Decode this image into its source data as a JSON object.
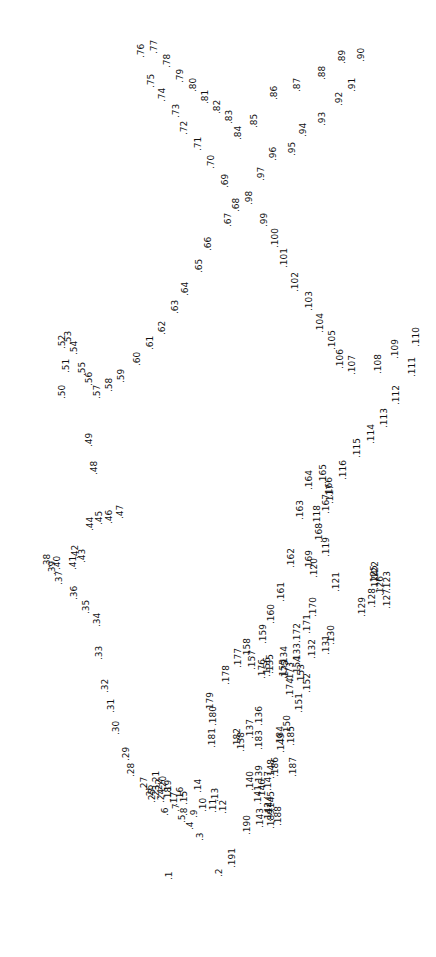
{
  "puzzle": {
    "kind": "connect-the-dots",
    "orientation": "labels-rotated-90-ccw",
    "background_color": "#ffffff",
    "text_color": "#111111",
    "font_size_px": 9,
    "total_points": 191,
    "marker": ".",
    "points": [
      {
        "n": "1",
        "x": 165,
        "y": 880
      },
      {
        "n": "2",
        "x": 215,
        "y": 877
      },
      {
        "n": "3",
        "x": 196,
        "y": 841
      },
      {
        "n": "4",
        "x": 186,
        "y": 830
      },
      {
        "n": "5",
        "x": 178,
        "y": 823
      },
      {
        "n": "6",
        "x": 161,
        "y": 816
      },
      {
        "n": "7",
        "x": 172,
        "y": 812
      },
      {
        "n": "8",
        "x": 180,
        "y": 816
      },
      {
        "n": "9",
        "x": 190,
        "y": 818
      },
      {
        "n": "10",
        "x": 199,
        "y": 812
      },
      {
        "n": "11",
        "x": 209,
        "y": 813
      },
      {
        "n": "12",
        "x": 219,
        "y": 814
      },
      {
        "n": "13",
        "x": 211,
        "y": 802
      },
      {
        "n": "14",
        "x": 194,
        "y": 793
      },
      {
        "n": "15",
        "x": 180,
        "y": 805
      },
      {
        "n": "16",
        "x": 176,
        "y": 801
      },
      {
        "n": "17",
        "x": 170,
        "y": 806
      },
      {
        "n": "18",
        "x": 164,
        "y": 801
      },
      {
        "n": "19",
        "x": 164,
        "y": 794
      },
      {
        "n": "20",
        "x": 159,
        "y": 790
      },
      {
        "n": "21",
        "x": 152,
        "y": 785
      },
      {
        "n": "22",
        "x": 155,
        "y": 793
      },
      {
        "n": "23",
        "x": 152,
        "y": 799
      },
      {
        "n": "24",
        "x": 157,
        "y": 803
      },
      {
        "n": "25",
        "x": 148,
        "y": 803
      },
      {
        "n": "26",
        "x": 146,
        "y": 799
      },
      {
        "n": "27",
        "x": 140,
        "y": 791
      },
      {
        "n": "28",
        "x": 127,
        "y": 777
      },
      {
        "n": "29",
        "x": 122,
        "y": 761
      },
      {
        "n": "30",
        "x": 112,
        "y": 735
      },
      {
        "n": "31",
        "x": 107,
        "y": 713
      },
      {
        "n": "32",
        "x": 101,
        "y": 693
      },
      {
        "n": "33",
        "x": 95,
        "y": 660
      },
      {
        "n": "34",
        "x": 93,
        "y": 627
      },
      {
        "n": "35",
        "x": 82,
        "y": 614
      },
      {
        "n": "36",
        "x": 70,
        "y": 600
      },
      {
        "n": "37",
        "x": 55,
        "y": 585
      },
      {
        "n": "38",
        "x": 43,
        "y": 568
      },
      {
        "n": "39",
        "x": 48,
        "y": 575
      },
      {
        "n": "40",
        "x": 53,
        "y": 570
      },
      {
        "n": "41",
        "x": 69,
        "y": 570
      },
      {
        "n": "42",
        "x": 71,
        "y": 559
      },
      {
        "n": "43",
        "x": 78,
        "y": 563
      },
      {
        "n": "44",
        "x": 86,
        "y": 531
      },
      {
        "n": "45",
        "x": 95,
        "y": 525
      },
      {
        "n": "46",
        "x": 105,
        "y": 524
      },
      {
        "n": "47",
        "x": 116,
        "y": 519
      },
      {
        "n": "48",
        "x": 90,
        "y": 475
      },
      {
        "n": "49",
        "x": 85,
        "y": 447
      },
      {
        "n": "50",
        "x": 58,
        "y": 399
      },
      {
        "n": "51",
        "x": 62,
        "y": 373
      },
      {
        "n": "52",
        "x": 58,
        "y": 349
      },
      {
        "n": "53",
        "x": 64,
        "y": 345
      },
      {
        "n": "54",
        "x": 70,
        "y": 355
      },
      {
        "n": "55",
        "x": 78,
        "y": 376
      },
      {
        "n": "56",
        "x": 85,
        "y": 386
      },
      {
        "n": "57",
        "x": 93,
        "y": 399
      },
      {
        "n": "58",
        "x": 105,
        "y": 392
      },
      {
        "n": "59",
        "x": 117,
        "y": 383
      },
      {
        "n": "60",
        "x": 133,
        "y": 366
      },
      {
        "n": "61",
        "x": 146,
        "y": 350
      },
      {
        "n": "62",
        "x": 158,
        "y": 335
      },
      {
        "n": "63",
        "x": 171,
        "y": 314
      },
      {
        "n": "64",
        "x": 181,
        "y": 296
      },
      {
        "n": "65",
        "x": 195,
        "y": 273
      },
      {
        "n": "66",
        "x": 204,
        "y": 251
      },
      {
        "n": "67",
        "x": 224,
        "y": 227
      },
      {
        "n": "68",
        "x": 232,
        "y": 212
      },
      {
        "n": "69",
        "x": 221,
        "y": 188
      },
      {
        "n": "70",
        "x": 207,
        "y": 169
      },
      {
        "n": "71",
        "x": 194,
        "y": 151
      },
      {
        "n": "72",
        "x": 180,
        "y": 135
      },
      {
        "n": "73",
        "x": 172,
        "y": 118
      },
      {
        "n": "74",
        "x": 158,
        "y": 102
      },
      {
        "n": "75",
        "x": 147,
        "y": 88
      },
      {
        "n": "76",
        "x": 137,
        "y": 58
      },
      {
        "n": "77",
        "x": 150,
        "y": 54
      },
      {
        "n": "78",
        "x": 163,
        "y": 68
      },
      {
        "n": "79",
        "x": 176,
        "y": 83
      },
      {
        "n": "80",
        "x": 189,
        "y": 92
      },
      {
        "n": "81",
        "x": 201,
        "y": 104
      },
      {
        "n": "82",
        "x": 213,
        "y": 114
      },
      {
        "n": "83",
        "x": 225,
        "y": 124
      },
      {
        "n": "84",
        "x": 234,
        "y": 140
      },
      {
        "n": "85",
        "x": 250,
        "y": 128
      },
      {
        "n": "86",
        "x": 270,
        "y": 100
      },
      {
        "n": "87",
        "x": 293,
        "y": 92
      },
      {
        "n": "88",
        "x": 318,
        "y": 80
      },
      {
        "n": "89",
        "x": 338,
        "y": 64
      },
      {
        "n": "90",
        "x": 357,
        "y": 62
      },
      {
        "n": "91",
        "x": 348,
        "y": 92
      },
      {
        "n": "92",
        "x": 335,
        "y": 106
      },
      {
        "n": "93",
        "x": 318,
        "y": 126
      },
      {
        "n": "94",
        "x": 299,
        "y": 137
      },
      {
        "n": "95",
        "x": 288,
        "y": 156
      },
      {
        "n": "96",
        "x": 269,
        "y": 161
      },
      {
        "n": "97",
        "x": 257,
        "y": 181
      },
      {
        "n": "98",
        "x": 245,
        "y": 205
      },
      {
        "n": "99",
        "x": 260,
        "y": 227
      },
      {
        "n": "100",
        "x": 271,
        "y": 248
      },
      {
        "n": "101",
        "x": 280,
        "y": 268
      },
      {
        "n": "102",
        "x": 291,
        "y": 292
      },
      {
        "n": "103",
        "x": 305,
        "y": 311
      },
      {
        "n": "104",
        "x": 316,
        "y": 333
      },
      {
        "n": "105",
        "x": 328,
        "y": 350
      },
      {
        "n": "106",
        "x": 336,
        "y": 369
      },
      {
        "n": "107",
        "x": 348,
        "y": 375
      },
      {
        "n": "108",
        "x": 374,
        "y": 374
      },
      {
        "n": "109",
        "x": 391,
        "y": 359
      },
      {
        "n": "110",
        "x": 412,
        "y": 347
      },
      {
        "n": "111",
        "x": 408,
        "y": 377
      },
      {
        "n": "112",
        "x": 392,
        "y": 405
      },
      {
        "n": "113",
        "x": 380,
        "y": 428
      },
      {
        "n": "114",
        "x": 367,
        "y": 444
      },
      {
        "n": "115",
        "x": 353,
        "y": 458
      },
      {
        "n": "116",
        "x": 339,
        "y": 480
      },
      {
        "n": "117",
        "x": 326,
        "y": 504
      },
      {
        "n": "118",
        "x": 313,
        "y": 525
      },
      {
        "n": "119",
        "x": 322,
        "y": 557
      },
      {
        "n": "120",
        "x": 310,
        "y": 578
      },
      {
        "n": "121",
        "x": 332,
        "y": 592
      },
      {
        "n": "122",
        "x": 371,
        "y": 581
      },
      {
        "n": "123",
        "x": 383,
        "y": 591
      },
      {
        "n": "124",
        "x": 371,
        "y": 590
      },
      {
        "n": "125",
        "x": 370,
        "y": 585
      },
      {
        "n": "126",
        "x": 376,
        "y": 596
      },
      {
        "n": "127",
        "x": 383,
        "y": 609
      },
      {
        "n": "128",
        "x": 368,
        "y": 608
      },
      {
        "n": "129",
        "x": 358,
        "y": 617
      },
      {
        "n": "130",
        "x": 327,
        "y": 645
      },
      {
        "n": "131",
        "x": 322,
        "y": 655
      },
      {
        "n": "132",
        "x": 308,
        "y": 659
      },
      {
        "n": "133",
        "x": 293,
        "y": 663
      },
      {
        "n": "134",
        "x": 280,
        "y": 666
      },
      {
        "n": "135",
        "x": 266,
        "y": 674
      },
      {
        "n": "136",
        "x": 255,
        "y": 726
      },
      {
        "n": "137",
        "x": 246,
        "y": 739
      },
      {
        "n": "138",
        "x": 237,
        "y": 752
      },
      {
        "n": "139",
        "x": 255,
        "y": 785
      },
      {
        "n": "140",
        "x": 246,
        "y": 791
      },
      {
        "n": "141",
        "x": 254,
        "y": 805
      },
      {
        "n": "142",
        "x": 264,
        "y": 822
      },
      {
        "n": "143",
        "x": 256,
        "y": 828
      },
      {
        "n": "144",
        "x": 265,
        "y": 816
      },
      {
        "n": "145",
        "x": 267,
        "y": 811
      },
      {
        "n": "146",
        "x": 258,
        "y": 799
      },
      {
        "n": "147",
        "x": 264,
        "y": 791
      },
      {
        "n": "148",
        "x": 267,
        "y": 779
      },
      {
        "n": "149",
        "x": 277,
        "y": 753
      },
      {
        "n": "150",
        "x": 283,
        "y": 735
      },
      {
        "n": "151",
        "x": 295,
        "y": 713
      },
      {
        "n": "152",
        "x": 303,
        "y": 693
      },
      {
        "n": "153",
        "x": 297,
        "y": 684
      },
      {
        "n": "154",
        "x": 293,
        "y": 676
      },
      {
        "n": "155",
        "x": 279,
        "y": 679
      },
      {
        "n": "156",
        "x": 263,
        "y": 677
      },
      {
        "n": "157",
        "x": 248,
        "y": 670
      },
      {
        "n": "158",
        "x": 243,
        "y": 658
      },
      {
        "n": "159",
        "x": 259,
        "y": 644
      },
      {
        "n": "160",
        "x": 267,
        "y": 624
      },
      {
        "n": "161",
        "x": 277,
        "y": 602
      },
      {
        "n": "162",
        "x": 287,
        "y": 568
      },
      {
        "n": "163",
        "x": 296,
        "y": 520
      },
      {
        "n": "164",
        "x": 305,
        "y": 490
      },
      {
        "n": "165",
        "x": 319,
        "y": 484
      },
      {
        "n": "166",
        "x": 325,
        "y": 497
      },
      {
        "n": "167",
        "x": 322,
        "y": 514
      },
      {
        "n": "168",
        "x": 315,
        "y": 543
      },
      {
        "n": "169",
        "x": 305,
        "y": 570
      },
      {
        "n": "170",
        "x": 309,
        "y": 617
      },
      {
        "n": "171",
        "x": 303,
        "y": 634
      },
      {
        "n": "172",
        "x": 293,
        "y": 643
      },
      {
        "n": "173",
        "x": 286,
        "y": 682
      },
      {
        "n": "174",
        "x": 286,
        "y": 698
      },
      {
        "n": "175",
        "x": 281,
        "y": 680
      },
      {
        "n": "176",
        "x": 258,
        "y": 679
      },
      {
        "n": "177",
        "x": 234,
        "y": 668
      },
      {
        "n": "178",
        "x": 222,
        "y": 685
      },
      {
        "n": "179",
        "x": 206,
        "y": 712
      },
      {
        "n": "180",
        "x": 209,
        "y": 726
      },
      {
        "n": "181",
        "x": 208,
        "y": 748
      },
      {
        "n": "182",
        "x": 233,
        "y": 748
      },
      {
        "n": "183",
        "x": 255,
        "y": 750
      },
      {
        "n": "184",
        "x": 276,
        "y": 746
      },
      {
        "n": "185",
        "x": 287,
        "y": 746
      },
      {
        "n": "186",
        "x": 271,
        "y": 777
      },
      {
        "n": "187",
        "x": 289,
        "y": 777
      },
      {
        "n": "188",
        "x": 274,
        "y": 826
      },
      {
        "n": "189",
        "x": 267,
        "y": 829
      },
      {
        "n": "190",
        "x": 243,
        "y": 835
      },
      {
        "n": "191",
        "x": 228,
        "y": 868
      }
    ]
  }
}
